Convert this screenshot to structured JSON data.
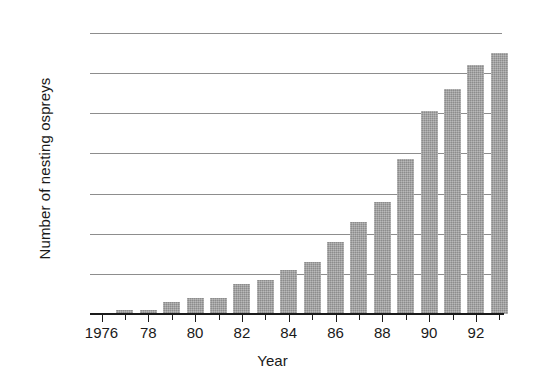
{
  "chart_data": {
    "type": "bar",
    "title": "",
    "xlabel": "Year",
    "ylabel": "Number of nesting ospreys",
    "categories": [
      1976,
      1977,
      1978,
      1979,
      1980,
      1981,
      1982,
      1983,
      1984,
      1985,
      1986,
      1987,
      1988,
      1989,
      1990,
      1991,
      1992,
      1993
    ],
    "values": [
      0,
      1,
      1,
      3,
      4,
      4,
      7.5,
      8.5,
      11,
      13,
      18,
      23,
      28,
      38.5,
      50.5,
      56,
      62,
      65
    ],
    "series": [
      {
        "name": "Number of nesting ospreys",
        "values": [
          0,
          1,
          1,
          3,
          4,
          4,
          7.5,
          8.5,
          11,
          13,
          18,
          23,
          28,
          38.5,
          50.5,
          56,
          62,
          65
        ]
      }
    ],
    "ylim": [
      0,
      70
    ],
    "ytick_values": [
      0,
      10,
      20,
      30,
      40,
      50,
      60,
      70
    ],
    "ytick_labels": [
      "0",
      "10",
      "20",
      "30",
      "40",
      "50",
      "60",
      "70"
    ],
    "xtick_labels": [
      "1976",
      "78",
      "80",
      "82",
      "84",
      "86",
      "88",
      "90",
      "92"
    ],
    "xtick_years": [
      1976,
      1978,
      1980,
      1982,
      1984,
      1986,
      1988,
      1990,
      1992
    ],
    "grid": "horizontal",
    "legend": "none",
    "bar_color": "#9b9b9b",
    "axis_color": "#1a1a1a",
    "gridline_color": "#8d8d8d",
    "background_color": "#ffffff"
  }
}
